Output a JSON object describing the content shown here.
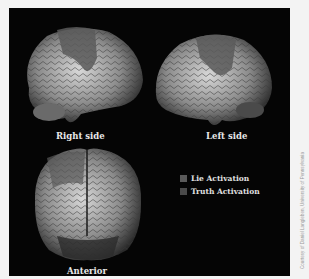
{
  "figure": {
    "panels": [
      {
        "id": "right",
        "label": "Right side"
      },
      {
        "id": "left",
        "label": "Left side"
      },
      {
        "id": "anterior",
        "label": "Anterior"
      }
    ],
    "legend": [
      {
        "label": "Lie Activation",
        "color": "#5a5a5a"
      },
      {
        "label": "Truth Activation",
        "color": "#4a4a4a"
      }
    ],
    "credit": "Courtesy of Daniel Langleben, University of Pennsylvania"
  }
}
